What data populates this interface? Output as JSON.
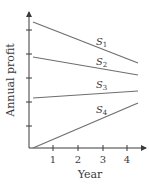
{
  "chart_data": {
    "type": "line",
    "title": "",
    "xlabel": "Year",
    "ylabel": "Annual profit",
    "x_ticks": [
      "1",
      "2",
      "3",
      "4"
    ],
    "y_ticks_count": 5,
    "y_ticks_labeled": false,
    "xlim": [
      0,
      4.5
    ],
    "grid": false,
    "legend": "inline labels",
    "series": [
      {
        "name": "S1",
        "label_base": "S",
        "label_sub": "1",
        "x": [
          0.1,
          4.5
        ],
        "y": [
          0.88,
          0.59
        ],
        "trend": "decreasing"
      },
      {
        "name": "S2",
        "label_base": "S",
        "label_sub": "2",
        "x": [
          0.1,
          4.5
        ],
        "y": [
          0.64,
          0.51
        ],
        "trend": "decreasing"
      },
      {
        "name": "S3",
        "label_base": "S",
        "label_sub": "3",
        "x": [
          0.1,
          4.5
        ],
        "y": [
          0.36,
          0.41
        ],
        "trend": "increasing"
      },
      {
        "name": "S4",
        "label_base": "S",
        "label_sub": "4",
        "x": [
          0.1,
          4.5
        ],
        "y": [
          0.0,
          0.32
        ],
        "trend": "increasing"
      }
    ]
  },
  "layout": {
    "origin": [
      29,
      148
    ],
    "x_axis_end": 146,
    "y_axis_top": 12,
    "x_unit_px": 24.7,
    "y_unit_px": 140,
    "x_tick_px": [
      53,
      78,
      103,
      127
    ],
    "y_tick_px": [
      126,
      102,
      78,
      54,
      30
    ],
    "series_px": [
      {
        "x1": 33,
        "y1": 22,
        "x2": 138,
        "y2": 63,
        "lx": 96,
        "ly": 45
      },
      {
        "x1": 33,
        "y1": 57,
        "x2": 138,
        "y2": 75,
        "lx": 96,
        "ly": 65
      },
      {
        "x1": 33,
        "y1": 98,
        "x2": 138,
        "y2": 91,
        "lx": 96,
        "ly": 88
      },
      {
        "x1": 33,
        "y1": 148,
        "x2": 138,
        "y2": 103,
        "lx": 96,
        "ly": 113
      }
    ]
  }
}
